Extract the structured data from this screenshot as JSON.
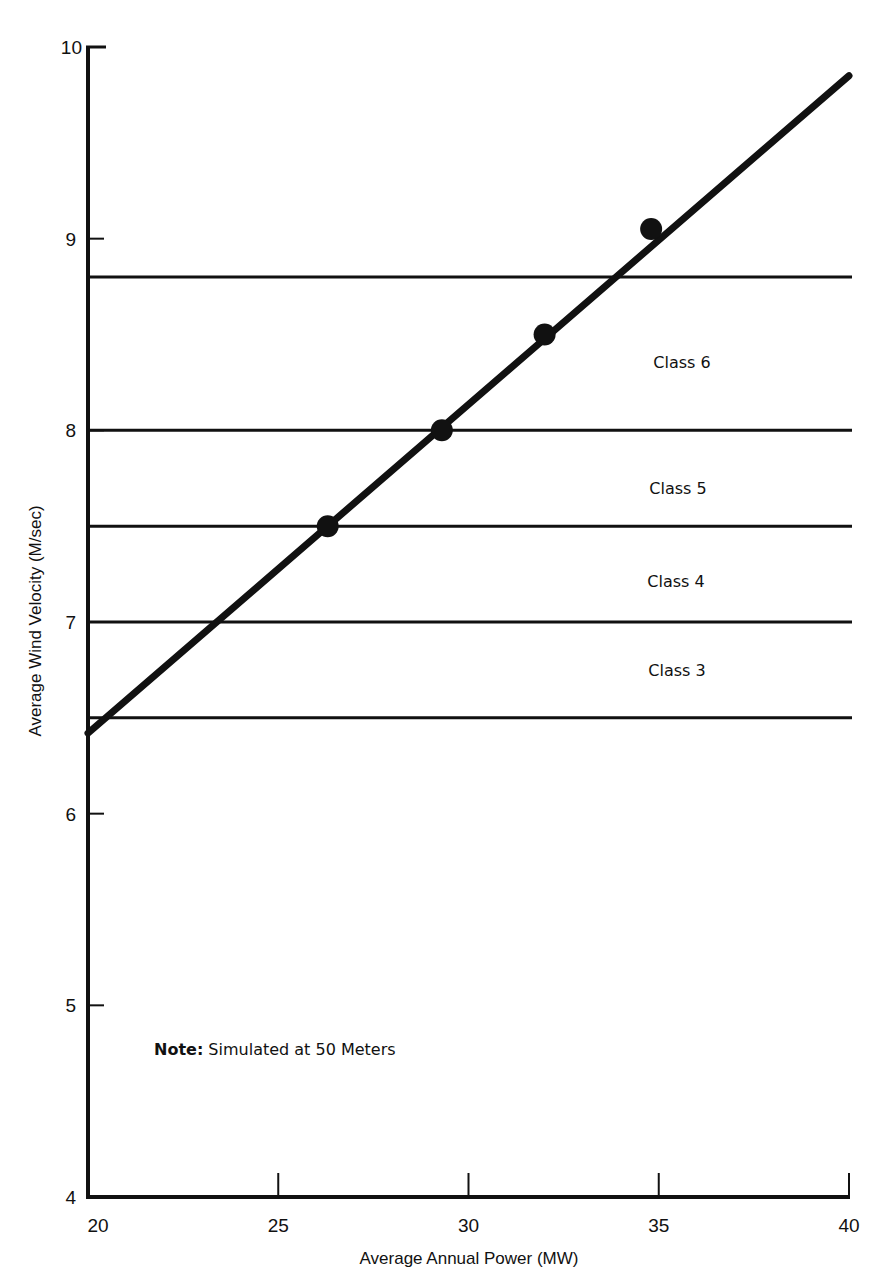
{
  "chart_data": {
    "type": "line",
    "title": "",
    "xlabel": "Average Annual Power (MW)",
    "ylabel": "Average Wind Velocity (M/sec)",
    "xlim": [
      20,
      40
    ],
    "ylim": [
      4,
      10
    ],
    "x_ticks": [
      20,
      25,
      30,
      35,
      40
    ],
    "y_ticks": [
      4,
      5,
      6,
      7,
      8,
      9,
      10
    ],
    "grid": false,
    "legend": null,
    "series": [
      {
        "name": "Data points",
        "kind": "scatter",
        "x": [
          26.3,
          29.3,
          32.0,
          34.8
        ],
        "y": [
          7.5,
          8.0,
          8.5,
          9.05
        ]
      },
      {
        "name": "Fitted line",
        "kind": "line",
        "x": [
          20,
          40
        ],
        "y": [
          6.42,
          9.85
        ]
      }
    ],
    "class_boundaries": [
      6.5,
      7.0,
      7.5,
      8.0,
      8.8
    ],
    "class_bands": [
      {
        "label": "Class 3",
        "from": 6.5,
        "to": 7.0
      },
      {
        "label": "Class 4",
        "from": 7.0,
        "to": 7.5
      },
      {
        "label": "Class 5",
        "from": 7.5,
        "to": 8.0
      },
      {
        "label": "Class 6",
        "from": 8.0,
        "to": 8.8
      }
    ],
    "annotations": [
      {
        "bold": "Note:",
        "text": " Simulated at 50 Meters"
      }
    ]
  },
  "labels": {
    "x_ticks": [
      "20",
      "25",
      "30",
      "35",
      "40"
    ],
    "y_ticks": [
      "4",
      "5",
      "6",
      "7",
      "8",
      "9",
      "10"
    ],
    "xlabel": "Average Annual Power (MW)",
    "ylabel": "Average Wind Velocity (M/sec)",
    "class3": "Class 3",
    "class4": "Class 4",
    "class5": "Class 5",
    "class6": "Class 6",
    "note_bold": "Note:",
    "note_text": " Simulated at 50 Meters"
  },
  "colors": {
    "ink": "#111111",
    "background": "#ffffff"
  }
}
